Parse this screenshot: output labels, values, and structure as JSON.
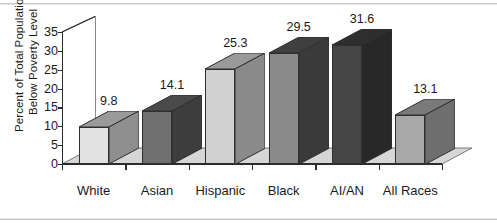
{
  "chart_data": {
    "type": "bar",
    "title": "",
    "subtitle": "",
    "xlabel": "",
    "ylabel_lines": [
      "Percent of Total Population",
      "Below Poverty Level"
    ],
    "categories": [
      "White",
      "Asian",
      "Hispanic",
      "Black",
      "AI/AN",
      "All Races"
    ],
    "values": [
      9.8,
      14.1,
      25.3,
      29.5,
      31.6,
      13.1
    ],
    "value_labels": [
      "9.8",
      "14.1",
      "25.3",
      "29.5",
      "31.6",
      "13.1"
    ],
    "ylim": [
      0,
      35
    ],
    "yticks": [
      0,
      5,
      10,
      15,
      20,
      25,
      30,
      35
    ],
    "ytick_labels": [
      "0",
      "5",
      "10",
      "15",
      "20",
      "25",
      "30",
      "35"
    ],
    "grid": false,
    "legend": null,
    "three_d": true,
    "bar_colors_front": [
      "#e2e2e2",
      "#6f6f6f",
      "#d2d2d2",
      "#8a8a8a",
      "#464646",
      "#a8a8a8"
    ],
    "bar_colors_side": [
      "#8f8f8f",
      "#3d3d3d",
      "#8a8a8a",
      "#3a3a3a",
      "#282828",
      "#6e6e6e"
    ],
    "bar_colors_top": [
      "#9a9a9a",
      "#4a4a4a",
      "#9a9a9a",
      "#3f3f3f",
      "#2e2e2e",
      "#7a7a7a"
    ],
    "floor_color": "#d6d6d6",
    "wall_color": "#ffffff",
    "axis_color": "#2b2b2b",
    "border_color": "#c8c8c8"
  }
}
